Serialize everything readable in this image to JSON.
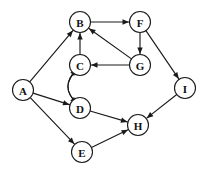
{
  "diagram": {
    "type": "directed-graph",
    "title": "",
    "background_color": "#ffffff",
    "node_stroke_color": "#1a1a1a",
    "node_fill_color": "#ffffff",
    "edge_color": "#1a1a1a",
    "node_radius": 10.5,
    "nodes": [
      {
        "id": "A",
        "label": "A",
        "x": 23,
        "y": 90
      },
      {
        "id": "B",
        "label": "B",
        "x": 80,
        "y": 22
      },
      {
        "id": "C",
        "label": "C",
        "x": 80,
        "y": 65
      },
      {
        "id": "D",
        "label": "D",
        "x": 80,
        "y": 108
      },
      {
        "id": "E",
        "label": "E",
        "x": 82,
        "y": 152
      },
      {
        "id": "F",
        "label": "F",
        "x": 140,
        "y": 22
      },
      {
        "id": "G",
        "label": "G",
        "x": 140,
        "y": 65
      },
      {
        "id": "H",
        "label": "H",
        "x": 138,
        "y": 125
      },
      {
        "id": "I",
        "label": "I",
        "x": 185,
        "y": 88
      }
    ],
    "edges": [
      {
        "from": "A",
        "to": "B",
        "shape": "straight",
        "directed": true
      },
      {
        "from": "A",
        "to": "D",
        "shape": "straight",
        "directed": true
      },
      {
        "from": "A",
        "to": "E",
        "shape": "straight",
        "directed": true
      },
      {
        "from": "B",
        "to": "F",
        "shape": "straight",
        "directed": true
      },
      {
        "from": "C",
        "to": "B",
        "shape": "straight",
        "directed": true
      },
      {
        "from": "C",
        "to": "D",
        "shape": "curved-right",
        "directed": true
      },
      {
        "from": "D",
        "to": "C",
        "shape": "curved-left",
        "directed": true
      },
      {
        "from": "D",
        "to": "H",
        "shape": "straight",
        "directed": true
      },
      {
        "from": "E",
        "to": "H",
        "shape": "straight",
        "directed": true
      },
      {
        "from": "F",
        "to": "G",
        "shape": "straight",
        "directed": true
      },
      {
        "from": "F",
        "to": "I",
        "shape": "straight",
        "directed": true
      },
      {
        "from": "G",
        "to": "B",
        "shape": "straight",
        "directed": true
      },
      {
        "from": "G",
        "to": "C",
        "shape": "straight",
        "directed": true
      },
      {
        "from": "I",
        "to": "H",
        "shape": "straight",
        "directed": true
      }
    ]
  }
}
